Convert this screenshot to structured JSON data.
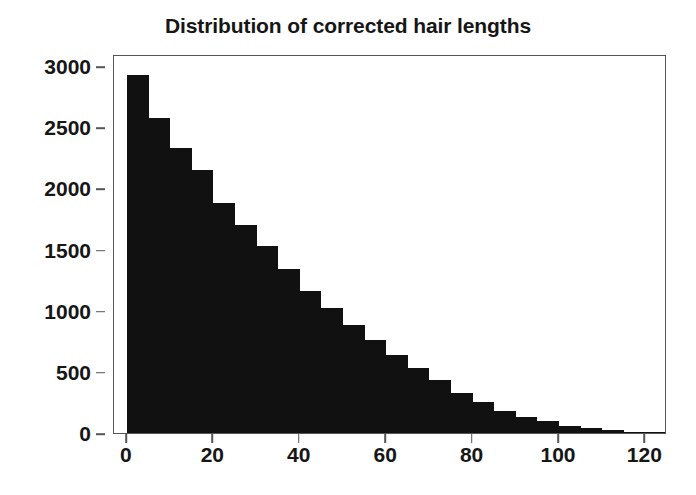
{
  "chart_data": {
    "type": "bar",
    "title": "Distribution of corrected hair lengths",
    "xlabel": "",
    "ylabel": "",
    "grid": false,
    "legend": false,
    "bin_width": 5,
    "xlim": [
      -3,
      125
    ],
    "ylim": [
      0,
      3100
    ],
    "xticks": [
      0,
      20,
      40,
      60,
      80,
      100,
      120
    ],
    "yticks": [
      0,
      500,
      1000,
      1500,
      2000,
      2500,
      3000
    ],
    "xtick_labels": [
      "0",
      "20",
      "40",
      "60",
      "80",
      "100",
      "120"
    ],
    "ytick_labels": [
      "0",
      "500",
      "1000",
      "1500",
      "2000",
      "2500",
      "3000"
    ],
    "bin_starts": [
      0,
      5,
      10,
      15,
      20,
      25,
      30,
      35,
      40,
      45,
      50,
      55,
      60,
      65,
      70,
      75,
      80,
      85,
      90,
      95,
      100,
      105,
      110,
      115,
      120
    ],
    "categories": [
      "0-5",
      "5-10",
      "10-15",
      "15-20",
      "20-25",
      "25-30",
      "30-35",
      "35-40",
      "40-45",
      "45-50",
      "50-55",
      "55-60",
      "60-65",
      "65-70",
      "70-75",
      "75-80",
      "80-85",
      "85-90",
      "90-95",
      "95-100",
      "100-105",
      "105-110",
      "110-115",
      "115-120",
      "120-125"
    ],
    "values": [
      2930,
      2580,
      2330,
      2150,
      1880,
      1700,
      1530,
      1340,
      1160,
      1020,
      880,
      760,
      640,
      530,
      430,
      330,
      250,
      180,
      130,
      95,
      60,
      40,
      25,
      12,
      5
    ],
    "bar_color": "#111111",
    "axis_color": "#555555",
    "text_color": "#161616"
  }
}
